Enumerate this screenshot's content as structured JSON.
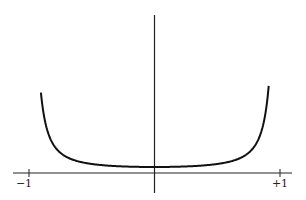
{
  "chart_data": {
    "type": "line",
    "title": "",
    "xlabel": "",
    "ylabel": "",
    "xlim": [
      -1.1,
      1.1
    ],
    "ylim": [
      0,
      13
    ],
    "x_ticks": [
      {
        "value": -1,
        "label": "−1"
      },
      {
        "value": 1,
        "label": "+1"
      }
    ],
    "series": [
      {
        "name": "curve",
        "x": [
          -0.9,
          -0.88,
          -0.86,
          -0.84,
          -0.82,
          -0.8,
          -0.75,
          -0.7,
          -0.6,
          -0.5,
          -0.4,
          -0.3,
          -0.2,
          -0.1,
          0,
          0.1,
          0.2,
          0.3,
          0.4,
          0.5,
          0.6,
          0.7,
          0.75,
          0.8,
          0.82,
          0.84,
          0.86,
          0.88,
          0.9,
          0.91
        ],
        "y": [
          12.2,
          8.6,
          6.3,
          4.8,
          3.8,
          3.1,
          2.1,
          1.55,
          1.0,
          0.75,
          0.6,
          0.52,
          0.47,
          0.44,
          0.43,
          0.44,
          0.47,
          0.52,
          0.6,
          0.75,
          1.0,
          1.55,
          2.1,
          3.1,
          3.8,
          4.8,
          6.3,
          8.6,
          12.2,
          13.0
        ]
      }
    ],
    "grid": false,
    "legend": "none"
  }
}
